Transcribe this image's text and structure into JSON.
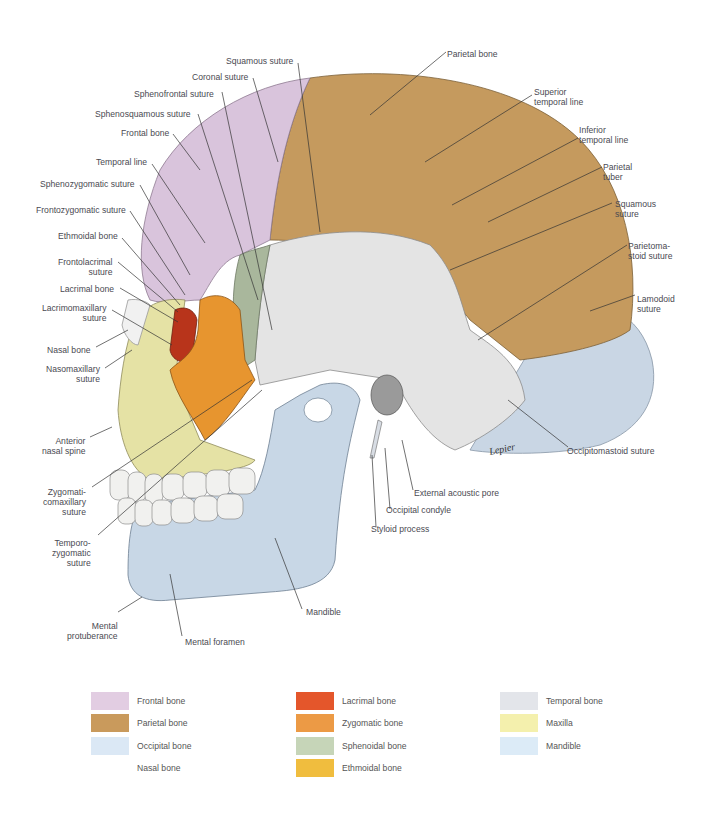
{
  "figure": {
    "artist_signature": "Lepier",
    "labels_left": [
      {
        "id": "squamous-suture-top",
        "text": "Squamous suture"
      },
      {
        "id": "coronal-suture",
        "text": "Coronal suture"
      },
      {
        "id": "sphenofrontal-suture",
        "text": "Sphenofrontal suture"
      },
      {
        "id": "sphenosquamous-suture",
        "text": "Sphenosquamous suture"
      },
      {
        "id": "frontal-bone",
        "text": "Frontal bone"
      },
      {
        "id": "temporal-line",
        "text": "Temporal line"
      },
      {
        "id": "sphenozygomatic-suture",
        "text": "Sphenozygomatic suture"
      },
      {
        "id": "frontozygomatic-suture",
        "text": "Frontozygomatic suture"
      },
      {
        "id": "ethmoidal-bone",
        "text": "Ethmoidal bone"
      },
      {
        "id": "frontolacrimal-suture",
        "text": "Frontolacrimal\nsuture"
      },
      {
        "id": "lacrimal-bone",
        "text": "Lacrimal bone"
      },
      {
        "id": "lacrimomaxillary-suture",
        "text": "Lacrimomaxillary\nsuture"
      },
      {
        "id": "nasal-bone",
        "text": "Nasal bone"
      },
      {
        "id": "nasomaxillary-suture",
        "text": "Nasomaxillary\nsuture"
      },
      {
        "id": "anterior-nasal-spine",
        "text": "Anterior\nnasal spine"
      },
      {
        "id": "zygomaticomaxillary-suture",
        "text": "Zygomati-\ncomaxillary\nsuture"
      },
      {
        "id": "temporozygomatic-suture",
        "text": "Temporo-\nzygomatic\nsuture"
      },
      {
        "id": "mental-protuberance",
        "text": "Mental\nprotuberance"
      },
      {
        "id": "mental-foramen",
        "text": "Mental foramen"
      }
    ],
    "labels_right": [
      {
        "id": "parietal-bone",
        "text": "Parietal bone"
      },
      {
        "id": "superior-temporal-line",
        "text": "Superior\ntemporal line"
      },
      {
        "id": "inferior-temporal-line",
        "text": "Inferior\ntemporal line"
      },
      {
        "id": "parietal-tuber",
        "text": "Parietal\ntuber"
      },
      {
        "id": "squamous-suture-right",
        "text": "Squamous\nsuture"
      },
      {
        "id": "parietomastoid-suture",
        "text": "Parietoma-\nstoid suture"
      },
      {
        "id": "lambdoid-suture",
        "text": "Lamodoid\nsuture"
      },
      {
        "id": "occipitomastoid-suture",
        "text": "Occipitomastoid suture"
      },
      {
        "id": "external-acoustic-pore",
        "text": "External acoustic pore"
      },
      {
        "id": "occipital-condyle",
        "text": "Occipital condyle"
      },
      {
        "id": "styloid-process",
        "text": "Styloid process"
      },
      {
        "id": "mandible",
        "text": "Mandible"
      }
    ]
  },
  "legend": {
    "columns": [
      [
        {
          "label": "Frontal bone",
          "color": "#e2cde2"
        },
        {
          "label": "Parietal bone",
          "color": "#c99a5c"
        },
        {
          "label": "Occipital bone",
          "color": "#dbe8f5"
        },
        {
          "label": "Nasal bone",
          "color": "#ffffff"
        }
      ],
      [
        {
          "label": "Lacrimal bone",
          "color": "#e4562b"
        },
        {
          "label": "Zygomatic bone",
          "color": "#ec9a45"
        },
        {
          "label": "Sphenoidal bone",
          "color": "#c6d5b8"
        },
        {
          "label": "Ethmoidal bone",
          "color": "#f0bd3e"
        }
      ],
      [
        {
          "label": "Temporal bone",
          "color": "#e3e5ea"
        },
        {
          "label": "Maxilla",
          "color": "#f4f0ad"
        },
        {
          "label": "Mandible",
          "color": "#dcebf7"
        }
      ]
    ]
  },
  "colors": {
    "frontal": "#d9c4dc",
    "parietal": "#c59a5e",
    "occipital": "#c9d6e4",
    "temporal": "#e4e4e4",
    "sphenoid": "#a9b79c",
    "zygomatic": "#e7952f",
    "lacrimal": "#b8341b",
    "maxilla": "#e5e2a5",
    "mandible": "#c8d7e6",
    "teeth": "#f1f1ef",
    "leader": "#333333"
  }
}
